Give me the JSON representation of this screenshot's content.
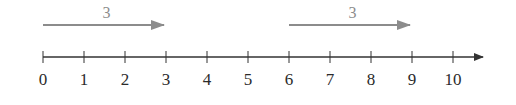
{
  "diagram": {
    "type": "number-line",
    "axis": {
      "min": 0,
      "max": 10,
      "step": 1,
      "tick_labels": [
        "0",
        "1",
        "2",
        "3",
        "4",
        "5",
        "6",
        "7",
        "8",
        "9",
        "10"
      ],
      "color": "#333333",
      "arrow_right": true
    },
    "jumps": [
      {
        "from": 0,
        "to": 3,
        "label": "3",
        "color": "#8c8c8c"
      },
      {
        "from": 6,
        "to": 9,
        "label": "3",
        "color": "#8c8c8c"
      }
    ]
  }
}
